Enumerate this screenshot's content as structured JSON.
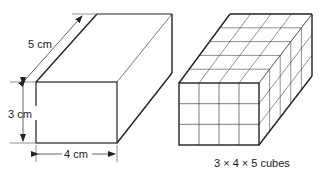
{
  "left_box": {
    "depth_label": "5 cm",
    "height_label": "3 cm",
    "width_label": "4 cm"
  },
  "right_box": {
    "caption": "3 × 4 × 5 cubes",
    "cubes": {
      "height": 3,
      "width": 4,
      "depth": 5
    }
  },
  "colors": {
    "stroke": "#222222",
    "background": "#ffffff"
  }
}
